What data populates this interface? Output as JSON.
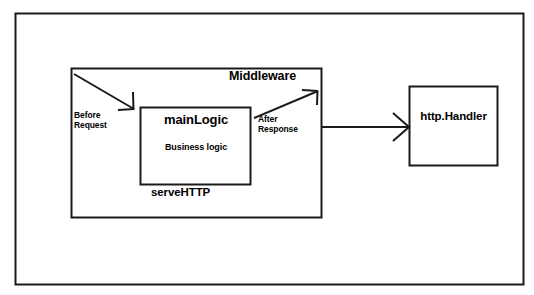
{
  "diagram": {
    "background_color": "#ffffff",
    "stroke_color": "#1a1a1a",
    "text_color": "#000000",
    "outer_frame": {
      "name": "outer-frame",
      "x": 15,
      "y": 13,
      "width": 509,
      "height": 272
    },
    "boxes": [
      {
        "id": "middleware",
        "label": "Middleware",
        "x": 71,
        "y": 68,
        "width": 251,
        "height": 150
      },
      {
        "id": "mainlogic",
        "label": "mainLogic",
        "sublabel": "Business logic",
        "x": 140,
        "y": 107,
        "width": 111,
        "height": 78
      },
      {
        "id": "servehttp",
        "label": "serveHTTP"
      },
      {
        "id": "httphandler",
        "label": "http.Handler",
        "x": 409,
        "y": 86,
        "width": 89,
        "height": 80
      }
    ],
    "arrows": [
      {
        "id": "before-request",
        "label": "Before\nRequest",
        "from": "middleware-top-left",
        "to": "mainlogic-top-left",
        "style": "diagonal-down-right"
      },
      {
        "id": "after-response",
        "label": "After\nResponse",
        "from": "mainlogic-right",
        "to": "middleware-top-right",
        "style": "diagonal-up-right"
      },
      {
        "id": "middleware-to-handler",
        "label": "",
        "from": "middleware-right",
        "to": "httphandler-left",
        "style": "horizontal-right"
      }
    ]
  }
}
